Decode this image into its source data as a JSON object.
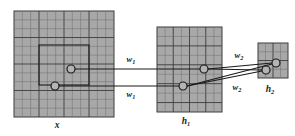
{
  "figure": {
    "type": "diagram",
    "background_color": "#ffffff",
    "grid_fill_color": "#a8a8a8",
    "grid_line_color": "#6e6e6e",
    "grid_major_line_color": "#3d3d3d",
    "stroke_color": "#1a1a1a",
    "node_fill_color": "#b4b4b4"
  },
  "layers": [
    {
      "id": "x",
      "label": "x",
      "label_x": 57,
      "label_y": 128,
      "x": 14,
      "y": 11,
      "w": 100,
      "h": 106,
      "cols": 12,
      "rows": 12,
      "major_every": 3
    },
    {
      "id": "h1",
      "label": "h",
      "subscript": "1",
      "label_x": 186,
      "label_y": 124,
      "x": 157,
      "y": 27,
      "w": 65,
      "h": 85,
      "cols": 8,
      "rows": 9,
      "major_every": 2
    },
    {
      "id": "h2",
      "label": "h",
      "subscript": "2",
      "label_x": 270,
      "label_y": 92,
      "x": 258,
      "y": 43,
      "w": 30,
      "h": 35,
      "cols": 4,
      "rows": 4,
      "major_every": 2
    }
  ],
  "receptive_fields": [
    {
      "name": "x-receptive-field-box",
      "x": 39,
      "y": 45,
      "w": 50,
      "h": 40
    }
  ],
  "nodes": [
    {
      "name": "node-x-upper",
      "layer": "x",
      "cx": 71,
      "cy": 69,
      "r": 4.0
    },
    {
      "name": "node-x-lower",
      "layer": "x",
      "cx": 55,
      "cy": 86,
      "r": 4.0
    },
    {
      "name": "node-h1-upper",
      "layer": "h1",
      "cx": 204,
      "cy": 69,
      "r": 4.0
    },
    {
      "name": "node-h1-lower",
      "layer": "h1",
      "cx": 183,
      "cy": 86,
      "r": 4.0
    },
    {
      "name": "node-h2-upper",
      "layer": "h2",
      "cx": 276,
      "cy": 63,
      "r": 4.0
    },
    {
      "name": "node-h2-lower",
      "layer": "h2",
      "cx": 266,
      "cy": 70,
      "r": 4.0
    }
  ],
  "connections": [
    {
      "name": "conn-x-upper-to-h1-upper",
      "x1": 75,
      "y1": 69,
      "x2": 200,
      "y2": 69
    },
    {
      "name": "conn-x-lower-to-h1-lower",
      "x1": 59,
      "y1": 86,
      "x2": 179,
      "y2": 86
    },
    {
      "name": "conn-h1-upper-to-h2-upper",
      "x1": 208,
      "y1": 69,
      "x2": 272,
      "y2": 63
    },
    {
      "name": "conn-h1-upper-to-h2-lower",
      "x1": 208,
      "y1": 69,
      "x2": 262,
      "y2": 70
    },
    {
      "name": "conn-h1-lower-to-h2-upper",
      "x1": 187,
      "y1": 86,
      "x2": 272,
      "y2": 64
    },
    {
      "name": "conn-h1-lower-to-h2-lower",
      "x1": 187,
      "y1": 86,
      "x2": 262,
      "y2": 71
    }
  ],
  "weight_labels": [
    {
      "name": "weight-label-w1-upper",
      "base": "w",
      "subscript": "1",
      "x": 131,
      "y": 62
    },
    {
      "name": "weight-label-w1-lower",
      "base": "w",
      "subscript": "1",
      "x": 131,
      "y": 97
    },
    {
      "name": "weight-label-w2-upper",
      "base": "w",
      "subscript": "2",
      "x": 239,
      "y": 58
    },
    {
      "name": "weight-label-w2-lower",
      "base": "w",
      "subscript": "2",
      "x": 237,
      "y": 90
    }
  ]
}
